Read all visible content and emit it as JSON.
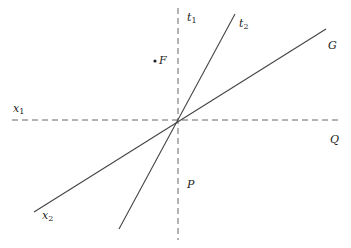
{
  "diagram": {
    "type": "geometric-lines",
    "colors": {
      "line": "#444444",
      "axis": "#555555",
      "text": "#222222",
      "background": "#ffffff"
    },
    "axes": {
      "horizontal": {
        "x1": 12,
        "y1": 120,
        "x2": 340,
        "y2": 120,
        "style": "dashed"
      },
      "vertical": {
        "x1": 178,
        "y1": 8,
        "x2": 178,
        "y2": 240,
        "style": "dashed"
      }
    },
    "lines": [
      {
        "id": "t2-line",
        "x1": 235,
        "y1": 14,
        "x2": 119,
        "y2": 229
      },
      {
        "id": "g-line",
        "x1": 326,
        "y1": 29,
        "x2": 34,
        "y2": 212
      }
    ],
    "point_f": {
      "cx": 155,
      "cy": 61,
      "r": 1.6
    },
    "labels": {
      "t1": {
        "base": "t",
        "sub": "1",
        "x": 187,
        "y": 21
      },
      "t2": {
        "base": "t",
        "sub": "2",
        "x": 239,
        "y": 27
      },
      "G": {
        "text": "G",
        "x": 328,
        "y": 49
      },
      "F": {
        "text": "F",
        "x": 159,
        "y": 64
      },
      "x1": {
        "base": "x",
        "sub": "1",
        "x": 13,
        "y": 112
      },
      "Q": {
        "text": "Q",
        "x": 330,
        "y": 143
      },
      "P": {
        "text": "P",
        "x": 187,
        "y": 188
      },
      "x2": {
        "base": "x",
        "sub": "2",
        "x": 42,
        "y": 219
      }
    }
  }
}
